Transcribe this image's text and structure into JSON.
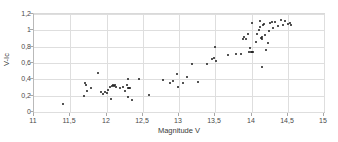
{
  "header_note": "",
  "chart_data": {
    "type": "scatter",
    "title": "",
    "xlabel": "Magnitude V",
    "ylabel": "V-Ic",
    "xlim": [
      11,
      15
    ],
    "ylim": [
      0,
      1.2
    ],
    "grid": true,
    "legend": "none",
    "decimal_separator": "comma",
    "xticks": [
      "11",
      "11,5",
      "12",
      "12,5",
      "13",
      "13,5",
      "14",
      "14,5",
      "15"
    ],
    "xtick_values": [
      11,
      11.5,
      12,
      12.5,
      13,
      13.5,
      14,
      14.5,
      15
    ],
    "yticks": [
      "0",
      "0,2",
      "0,4",
      "0,6",
      "0,8",
      "1",
      "1,2"
    ],
    "ytick_values": [
      0,
      0.2,
      0.4,
      0.6,
      0.8,
      1.0,
      1.2
    ],
    "marker": {
      "shape": "circle",
      "color": "#1a1a1a",
      "size_px": 2
    },
    "series": [
      {
        "name": "stars",
        "points": [
          [
            11.4,
            0.1
          ],
          [
            11.69,
            0.2
          ],
          [
            11.7,
            0.35
          ],
          [
            11.72,
            0.33
          ],
          [
            11.73,
            0.26
          ],
          [
            11.79,
            0.3
          ],
          [
            11.88,
            0.48
          ],
          [
            11.92,
            0.24
          ],
          [
            11.95,
            0.22
          ],
          [
            11.98,
            0.24
          ],
          [
            12.0,
            0.23
          ],
          [
            12.02,
            0.27
          ],
          [
            12.05,
            0.31
          ],
          [
            12.07,
            0.32
          ],
          [
            12.09,
            0.33
          ],
          [
            12.1,
            0.32
          ],
          [
            12.12,
            0.33
          ],
          [
            12.13,
            0.31
          ],
          [
            12.06,
            0.16
          ],
          [
            12.18,
            0.3
          ],
          [
            12.22,
            0.31
          ],
          [
            12.25,
            0.26
          ],
          [
            12.28,
            0.33
          ],
          [
            12.29,
            0.41
          ],
          [
            12.3,
            0.3
          ],
          [
            12.31,
            0.29
          ],
          [
            12.33,
            0.29
          ],
          [
            12.3,
            0.19
          ],
          [
            12.35,
            0.15
          ],
          [
            12.45,
            0.4
          ],
          [
            12.58,
            0.21
          ],
          [
            12.78,
            0.39
          ],
          [
            12.87,
            0.36
          ],
          [
            12.92,
            0.38
          ],
          [
            12.97,
            0.47
          ],
          [
            12.99,
            0.31
          ],
          [
            13.05,
            0.35
          ],
          [
            13.11,
            0.43
          ],
          [
            13.18,
            0.59
          ],
          [
            13.26,
            0.37
          ],
          [
            13.38,
            0.59
          ],
          [
            13.45,
            0.65
          ],
          [
            13.48,
            0.66
          ],
          [
            13.5,
            0.8
          ],
          [
            13.51,
            0.62
          ],
          [
            13.68,
            0.7
          ],
          [
            13.78,
            0.71
          ],
          [
            13.85,
            0.71
          ],
          [
            13.88,
            0.89
          ],
          [
            13.9,
            0.92
          ],
          [
            13.92,
            0.9
          ],
          [
            13.95,
            0.95
          ],
          [
            13.97,
            0.73
          ],
          [
            13.98,
            0.78
          ],
          [
            13.99,
            0.74
          ],
          [
            14.0,
            1.09
          ],
          [
            14.01,
            0.73
          ],
          [
            14.02,
            0.74
          ],
          [
            14.06,
            0.86
          ],
          [
            14.08,
            0.96
          ],
          [
            14.1,
            1.0
          ],
          [
            14.11,
            1.04
          ],
          [
            14.12,
            1.12
          ],
          [
            14.13,
            0.91
          ],
          [
            14.14,
            0.9
          ],
          [
            14.15,
            0.92
          ],
          [
            14.16,
            1.06
          ],
          [
            14.17,
            1.08
          ],
          [
            14.18,
            0.94
          ],
          [
            14.14,
            0.55
          ],
          [
            14.2,
            0.76
          ],
          [
            14.22,
            0.84
          ],
          [
            14.24,
            0.99
          ],
          [
            14.26,
            1.09
          ],
          [
            14.28,
            1.1
          ],
          [
            14.3,
            1.03
          ],
          [
            14.32,
            1.1
          ],
          [
            14.36,
            1.05
          ],
          [
            14.4,
            1.13
          ],
          [
            14.44,
            1.06
          ],
          [
            14.46,
            1.11
          ],
          [
            14.5,
            1.08
          ],
          [
            14.53,
            1.09
          ],
          [
            14.55,
            1.06
          ]
        ]
      }
    ]
  }
}
